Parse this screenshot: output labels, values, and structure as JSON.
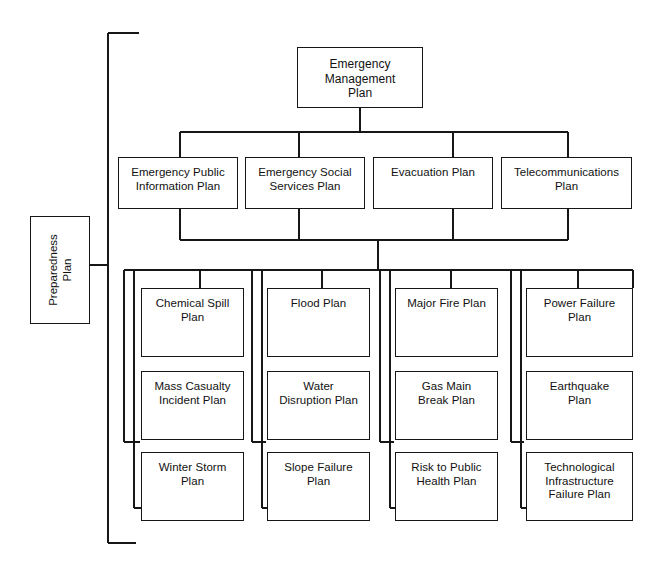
{
  "diagram": {
    "title_node": {
      "label": "Emergency\nManagement\nPlan"
    },
    "side_node": {
      "label": "Preparedness\nPlan"
    },
    "tier2": [
      {
        "label": "Emergency Public\nInformation Plan"
      },
      {
        "label": "Emergency Social\nServices Plan"
      },
      {
        "label": "Evacuation Plan"
      },
      {
        "label": "Telecommunications\nPlan"
      }
    ],
    "columns": [
      {
        "items": [
          {
            "label": "Chemical Spill\nPlan"
          },
          {
            "label": "Mass Casualty\nIncident Plan"
          },
          {
            "label": "Winter Storm\nPlan"
          }
        ]
      },
      {
        "items": [
          {
            "label": "Flood Plan"
          },
          {
            "label": "Water\nDisruption Plan"
          },
          {
            "label": "Slope Failure\nPlan"
          }
        ]
      },
      {
        "items": [
          {
            "label": "Major Fire Plan"
          },
          {
            "label": "Gas Main\nBreak Plan"
          },
          {
            "label": "Risk to Public\nHealth Plan"
          }
        ]
      },
      {
        "items": [
          {
            "label": "Power Failure\nPlan"
          },
          {
            "label": "Earthquake\nPlan"
          },
          {
            "label": "Technological\nInfrastructure\nFailure Plan"
          }
        ]
      }
    ],
    "colors": {
      "line": "#161616",
      "box_fill": "#ffffff",
      "text": "#111111"
    }
  }
}
